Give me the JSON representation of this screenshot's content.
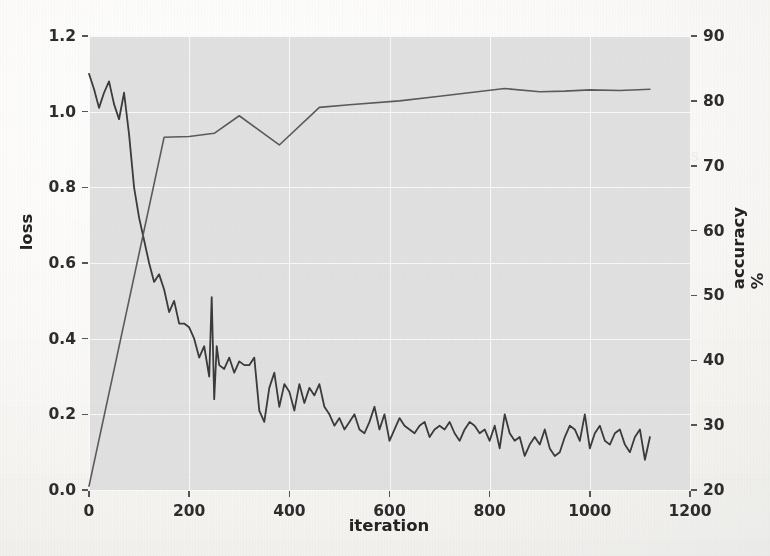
{
  "chart_data": {
    "type": "line",
    "title": "",
    "xlabel": "iteration",
    "ylabel": "loss",
    "y2label": "accuracy %",
    "xlim": [
      0,
      1200
    ],
    "ylim": [
      0.0,
      1.2
    ],
    "y2lim": [
      20,
      90
    ],
    "grid": true,
    "legend": "none",
    "xticks": [
      "0",
      "200",
      "400",
      "600",
      "800",
      "1000",
      "1200"
    ],
    "xtick_values": [
      0,
      200,
      400,
      600,
      800,
      1000,
      1200
    ],
    "yticks": [
      "0.0",
      "0.2",
      "0.4",
      "0.6",
      "0.8",
      "1.0",
      "1.2"
    ],
    "ytick_values": [
      0.0,
      0.2,
      0.4,
      0.6,
      0.8,
      1.0,
      1.2
    ],
    "y2ticks": [
      "20",
      "30",
      "40",
      "50",
      "60",
      "70",
      "80",
      "90"
    ],
    "y2tick_values": [
      20,
      30,
      40,
      50,
      60,
      70,
      80,
      90
    ],
    "series": [
      {
        "name": "loss",
        "axis": "left",
        "color": "#3a3a3a",
        "linewidth": 1.8,
        "x": [
          0,
          10,
          20,
          30,
          40,
          50,
          60,
          70,
          80,
          90,
          100,
          110,
          120,
          130,
          140,
          150,
          160,
          170,
          180,
          190,
          200,
          210,
          220,
          230,
          240,
          245,
          250,
          255,
          260,
          270,
          280,
          290,
          300,
          310,
          320,
          330,
          340,
          350,
          360,
          370,
          380,
          390,
          400,
          410,
          420,
          430,
          440,
          450,
          460,
          470,
          480,
          490,
          500,
          510,
          520,
          530,
          540,
          550,
          560,
          570,
          580,
          590,
          600,
          610,
          620,
          630,
          640,
          650,
          660,
          670,
          680,
          690,
          700,
          710,
          720,
          730,
          740,
          750,
          760,
          770,
          780,
          790,
          800,
          810,
          820,
          830,
          840,
          850,
          860,
          870,
          880,
          890,
          900,
          910,
          920,
          930,
          940,
          950,
          960,
          970,
          980,
          990,
          1000,
          1010,
          1020,
          1030,
          1040,
          1050,
          1060,
          1070,
          1080,
          1090,
          1100,
          1110,
          1120
        ],
        "y": [
          1.1,
          1.06,
          1.01,
          1.05,
          1.08,
          1.02,
          0.98,
          1.05,
          0.94,
          0.8,
          0.72,
          0.66,
          0.6,
          0.55,
          0.57,
          0.53,
          0.47,
          0.5,
          0.44,
          0.44,
          0.43,
          0.4,
          0.35,
          0.38,
          0.3,
          0.51,
          0.24,
          0.38,
          0.33,
          0.32,
          0.35,
          0.31,
          0.34,
          0.33,
          0.33,
          0.35,
          0.21,
          0.18,
          0.27,
          0.31,
          0.22,
          0.28,
          0.26,
          0.21,
          0.28,
          0.23,
          0.27,
          0.25,
          0.28,
          0.22,
          0.2,
          0.17,
          0.19,
          0.16,
          0.18,
          0.2,
          0.16,
          0.15,
          0.18,
          0.22,
          0.16,
          0.2,
          0.13,
          0.16,
          0.19,
          0.17,
          0.16,
          0.15,
          0.17,
          0.18,
          0.14,
          0.16,
          0.17,
          0.16,
          0.18,
          0.15,
          0.13,
          0.16,
          0.18,
          0.17,
          0.15,
          0.16,
          0.13,
          0.17,
          0.11,
          0.2,
          0.15,
          0.13,
          0.14,
          0.09,
          0.12,
          0.14,
          0.12,
          0.16,
          0.11,
          0.09,
          0.1,
          0.14,
          0.17,
          0.16,
          0.13,
          0.2,
          0.11,
          0.15,
          0.17,
          0.13,
          0.12,
          0.15,
          0.16,
          0.12,
          0.1,
          0.14,
          0.16,
          0.08,
          0.14
        ]
      },
      {
        "name": "accuracy",
        "axis": "right",
        "color": "#5a5a5a",
        "linewidth": 1.6,
        "x": [
          0,
          150,
          200,
          250,
          300,
          380,
          460,
          520,
          620,
          700,
          830,
          900,
          950,
          1000,
          1060,
          1120
        ],
        "y": [
          20.6,
          74.4,
          74.5,
          75.0,
          77.7,
          73.2,
          79.0,
          79.4,
          80.0,
          80.7,
          81.9,
          81.4,
          81.5,
          81.7,
          81.6,
          81.8
        ]
      }
    ]
  },
  "style": {
    "plot_background": "#e1e1e1",
    "page_background": "#fbfaf8",
    "gridline_color": "#fafafa",
    "tick_text_color": "#2c2c2c"
  },
  "bleed_text": {
    "page": [
      "results of our experiments",
      "the reported accuracy and loss",
      "we observe that the model",
      "converges after a few hundred",
      "iterations on the validation set",
      "Table 2 summarizes the final",
      "scores obtained by each method"
    ]
  }
}
